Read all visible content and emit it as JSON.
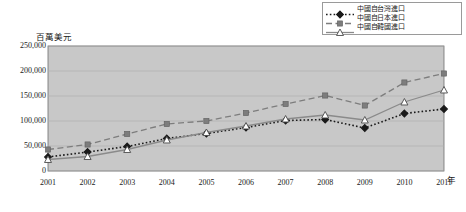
{
  "chart_data": {
    "type": "line",
    "title": "",
    "subtitle": "",
    "xlabel": "年",
    "ylabel": "百萬美元",
    "categories": [
      "2001",
      "2002",
      "2003",
      "2004",
      "2005",
      "2006",
      "2007",
      "2008",
      "2009",
      "2010",
      "2011"
    ],
    "x": [
      2001,
      2002,
      2003,
      2004,
      2005,
      2006,
      2007,
      2008,
      2009,
      2010,
      2011
    ],
    "ylim": [
      0,
      250000
    ],
    "ytick_labels": [
      "250,000",
      "200,000",
      "150,000",
      "100,000",
      "50,000",
      "0"
    ],
    "ytick_values": [
      250000,
      200000,
      150000,
      100000,
      50000,
      0
    ],
    "grid": true,
    "legend_position": "top-right",
    "plot_background": "#c8c8c8",
    "series": [
      {
        "name": "中國自台灣進口",
        "values": [
          28000,
          38000,
          49000,
          65000,
          75000,
          87000,
          101000,
          103000,
          86000,
          115000,
          124000
        ],
        "color": "#1a1a1a",
        "marker": "diamond",
        "line_style": "dotted"
      },
      {
        "name": "中國自日本進口",
        "values": [
          43000,
          53000,
          74000,
          94000,
          100000,
          116000,
          134000,
          151000,
          131000,
          177000,
          195000
        ],
        "color": "#7d7d7d",
        "marker": "square",
        "line_style": "dashed"
      },
      {
        "name": "中國自韓國進口",
        "values": [
          23000,
          29000,
          43000,
          62000,
          77000,
          90000,
          104000,
          112000,
          102000,
          138000,
          162000
        ],
        "color": "#8a8a8a",
        "marker": "triangle-open",
        "line_style": "solid"
      }
    ]
  },
  "legend": {
    "items": [
      {
        "label": "中國自台灣進口"
      },
      {
        "label": "中國自日本進口"
      },
      {
        "label": "中國自韓國進口"
      }
    ]
  },
  "axes": {
    "y_title": "百萬美元",
    "x_title": "年"
  }
}
